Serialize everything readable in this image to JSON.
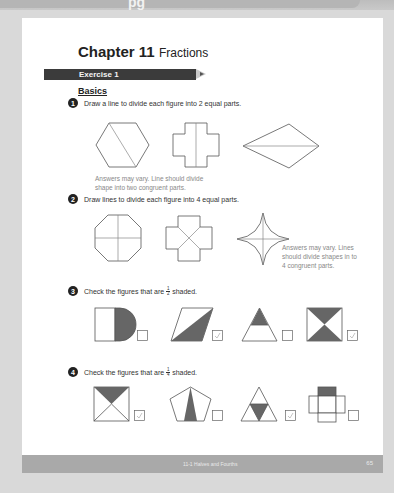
{
  "top_banner": {
    "glyph": "pg"
  },
  "chapter": {
    "label": "Chapter 11",
    "title": "Fractions"
  },
  "exercise": {
    "label": "Exercise 1"
  },
  "section": {
    "label": "Basics"
  },
  "questions": [
    {
      "num": "1",
      "text": "Draw a line to divide each figure into 2 equal parts.",
      "answer": [
        "Answers may vary. Line should divide",
        "shape into two congruent parts."
      ]
    },
    {
      "num": "2",
      "text": "Draw lines to divide each figure into 4 equal parts.",
      "answer": [
        "Answers may vary. Lines",
        "should divide shapes in to",
        "4 congruent parts."
      ]
    },
    {
      "num": "3",
      "text_before": "Check the figures that are",
      "frac_num": "1",
      "frac_den": "2",
      "text_after": "shaded.",
      "checks": [
        false,
        true,
        false,
        true
      ]
    },
    {
      "num": "4",
      "text_before": "Check the figures that are",
      "frac_num": "1",
      "frac_den": "4",
      "text_after": "shaded.",
      "checks": [
        true,
        false,
        true,
        false
      ]
    }
  ],
  "footer": {
    "section": "11-1 Halves and Fourths",
    "page": "65"
  },
  "check_mark": "✓",
  "colors": {
    "shade": "#666666",
    "line": "#555555",
    "answer": "#888888",
    "check": "#9a9a9a"
  }
}
